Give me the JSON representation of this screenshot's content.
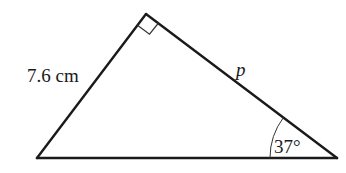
{
  "diagram": {
    "type": "right-triangle",
    "vertices": {
      "top": [
        146,
        14
      ],
      "bottom_left": [
        37,
        158
      ],
      "bottom_right": [
        337,
        158
      ]
    },
    "right_angle_at": "top",
    "labels": {
      "left_side": "7.6 cm",
      "right_side": "p",
      "angle": "37°"
    },
    "colors": {
      "stroke": "#1a1a1a",
      "background": "#ffffff"
    }
  }
}
